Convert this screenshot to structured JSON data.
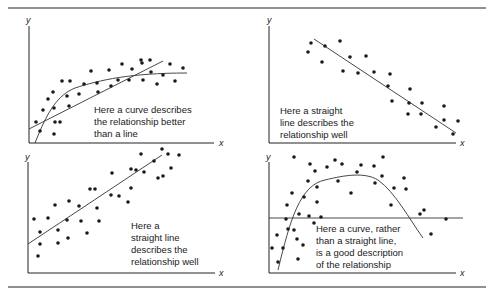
{
  "chart_data": [
    {
      "type": "scatter",
      "panel": "top-left",
      "xlabel": "x",
      "ylabel": "y",
      "annotation": [
        "Here a curve describes",
        "the relationship better",
        "than a line"
      ],
      "fits": [
        "curve (rising, flattening)",
        "straight line"
      ],
      "points": [
        [
          36,
          122
        ],
        [
          40,
          131
        ],
        [
          43,
          110
        ],
        [
          48,
          99
        ],
        [
          53,
          92
        ],
        [
          54,
          108
        ],
        [
          54,
          134
        ],
        [
          55,
          122
        ],
        [
          60,
          122
        ],
        [
          62,
          81
        ],
        [
          67,
          96
        ],
        [
          69,
          106
        ],
        [
          70,
          81
        ],
        [
          79,
          94
        ],
        [
          84,
          84
        ],
        [
          91,
          71
        ],
        [
          97,
          83
        ],
        [
          98,
          92
        ],
        [
          109,
          70
        ],
        [
          111,
          86
        ],
        [
          118,
          80
        ],
        [
          122,
          64
        ],
        [
          129,
          80
        ],
        [
          132,
          69
        ],
        [
          141,
          60
        ],
        [
          142,
          63
        ],
        [
          143,
          80
        ],
        [
          150,
          60
        ],
        [
          151,
          72
        ],
        [
          157,
          84
        ],
        [
          163,
          75
        ],
        [
          170,
          64
        ],
        [
          175,
          81
        ],
        [
          183,
          68
        ]
      ]
    },
    {
      "type": "scatter",
      "panel": "top-right",
      "xlabel": "x",
      "ylabel": "y",
      "annotation": [
        "Here a straight",
        "line describes the",
        "relationship well"
      ],
      "fits": [
        "straight line (negative slope)"
      ],
      "points": [
        [
          308,
          52
        ],
        [
          311,
          43
        ],
        [
          322,
          62
        ],
        [
          325,
          46
        ],
        [
          340,
          41
        ],
        [
          343,
          71
        ],
        [
          350,
          57
        ],
        [
          358,
          73
        ],
        [
          366,
          56
        ],
        [
          374,
          72
        ],
        [
          390,
          74
        ],
        [
          388,
          86
        ],
        [
          392,
          101
        ],
        [
          410,
          89
        ],
        [
          409,
          103
        ],
        [
          408,
          114
        ],
        [
          422,
          103
        ],
        [
          421,
          114
        ],
        [
          436,
          127
        ],
        [
          444,
          106
        ],
        [
          444,
          120
        ],
        [
          453,
          134
        ],
        [
          458,
          121
        ]
      ]
    },
    {
      "type": "scatter",
      "panel": "bottom-left",
      "xlabel": "x",
      "ylabel": "y",
      "annotation": [
        "Here a",
        "straight line",
        "describes the",
        "relationship well"
      ],
      "fits": [
        "straight line (positive slope)"
      ],
      "points": [
        [
          34,
          219
        ],
        [
          38,
          256
        ],
        [
          40,
          232
        ],
        [
          40,
          244
        ],
        [
          48,
          218
        ],
        [
          55,
          205
        ],
        [
          58,
          230
        ],
        [
          58,
          243
        ],
        [
          67,
          220
        ],
        [
          68,
          238
        ],
        [
          69,
          201
        ],
        [
          79,
          206
        ],
        [
          81,
          221
        ],
        [
          87,
          233
        ],
        [
          90,
          189
        ],
        [
          95,
          189
        ],
        [
          97,
          208
        ],
        [
          99,
          221
        ],
        [
          111,
          195
        ],
        [
          112,
          173
        ],
        [
          119,
          196
        ],
        [
          128,
          202
        ],
        [
          131,
          169
        ],
        [
          131,
          188
        ],
        [
          136,
          170
        ],
        [
          141,
          154
        ],
        [
          144,
          172
        ],
        [
          154,
          161
        ],
        [
          158,
          178
        ],
        [
          162,
          149
        ],
        [
          163,
          176
        ],
        [
          168,
          154
        ],
        [
          171,
          168
        ],
        [
          179,
          155
        ]
      ]
    },
    {
      "type": "scatter",
      "panel": "bottom-right",
      "xlabel": "x",
      "ylabel": "y",
      "annotation": [
        "Here a curve, rather",
        "than a straight line,",
        "is a good description",
        "of the relationship"
      ],
      "fits": [
        "curve (inverted U)",
        "horizontal straight line"
      ],
      "points": [
        [
          272,
          248
        ],
        [
          277,
          235
        ],
        [
          278,
          262
        ],
        [
          283,
          248
        ],
        [
          286,
          219
        ],
        [
          287,
          205
        ],
        [
          288,
          229
        ],
        [
          292,
          193
        ],
        [
          294,
          230
        ],
        [
          294,
          157
        ],
        [
          297,
          239
        ],
        [
          298,
          259
        ],
        [
          299,
          214
        ],
        [
          303,
          245
        ],
        [
          304,
          197
        ],
        [
          308,
          181
        ],
        [
          309,
          216
        ],
        [
          310,
          164
        ],
        [
          314,
          223
        ],
        [
          315,
          171
        ],
        [
          317,
          202
        ],
        [
          317,
          187
        ],
        [
          321,
          217
        ],
        [
          327,
          167
        ],
        [
          335,
          160
        ],
        [
          338,
          181
        ],
        [
          342,
          164
        ],
        [
          351,
          193
        ],
        [
          357,
          172
        ],
        [
          361,
          165
        ],
        [
          374,
          166
        ],
        [
          375,
          183
        ],
        [
          383,
          157
        ],
        [
          382,
          176
        ],
        [
          394,
          188
        ],
        [
          391,
          205
        ],
        [
          404,
          178
        ],
        [
          406,
          189
        ],
        [
          420,
          214
        ],
        [
          424,
          210
        ],
        [
          431,
          234
        ],
        [
          446,
          219
        ]
      ]
    }
  ]
}
